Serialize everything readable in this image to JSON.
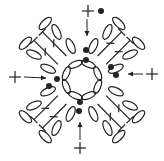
{
  "diagram": {
    "type": "crochet-chart",
    "title": "",
    "colors": {
      "stroke": "#222222",
      "background": "#ffffff"
    },
    "legend": {
      "chain": "oval",
      "double_crochet": "T with cross bar",
      "slip_stitch": "dot",
      "start_marker": "plus",
      "direction": "arrow"
    },
    "center": [
      82,
      80
    ],
    "ring_chains": 8,
    "markers": [
      {
        "side": "top",
        "plus": [
          88,
          11
        ],
        "arrow": [
          [
            87,
            19
          ],
          [
            87,
            36
          ]
        ],
        "dot": [
          86,
          50
        ]
      },
      {
        "side": "right",
        "plus": [
          152,
          74
        ],
        "arrow": [
          [
            143,
            74
          ],
          [
            128,
            74
          ]
        ],
        "dot": [
          116,
          75
        ]
      },
      {
        "side": "bottom",
        "plus": [
          80,
          148
        ],
        "arrow": [
          [
            80,
            140
          ],
          [
            80,
            122
          ]
        ],
        "dot": [
          79,
          111
        ]
      },
      {
        "side": "left",
        "plus": [
          15,
          77
        ],
        "arrow": [
          [
            24,
            77
          ],
          [
            46,
            78
          ]
        ],
        "dot": [
          57,
          79
        ]
      }
    ],
    "extra_dots": [
      [
        101,
        11
      ],
      [
        86,
        60
      ],
      [
        111,
        67
      ],
      [
        80,
        102
      ],
      [
        49,
        86
      ]
    ]
  }
}
